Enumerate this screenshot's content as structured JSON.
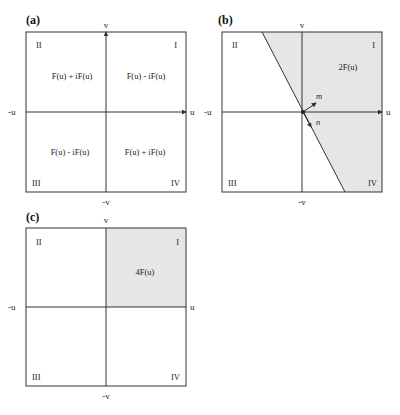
{
  "colors": {
    "shade": "#e6e6e6",
    "line": "#333333",
    "background": "#ffffff"
  },
  "axis_labels": {
    "u_pos": "u",
    "u_neg": "-u",
    "v_pos": "v",
    "v_neg": "-v"
  },
  "quadrants": {
    "q1": "I",
    "q2": "II",
    "q3": "III",
    "q4": "IV"
  },
  "panels": [
    {
      "label": "(a)",
      "expressions": {
        "q1": "F(u) - iF(u)",
        "q2": "F(u) + iF(u)",
        "q3": "F(u) - iF(u)",
        "q4": "F(u) + iF(u)"
      }
    },
    {
      "label": "(b)",
      "shaded_region_label": "2F(u)",
      "vectors": {
        "m": "m",
        "n": "n"
      }
    },
    {
      "label": "(c)",
      "shaded_region_label": "4F(u)"
    }
  ]
}
